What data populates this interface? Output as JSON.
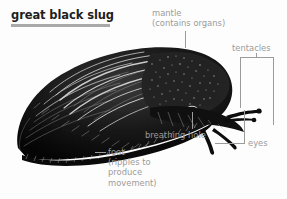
{
  "figure": {
    "title": "great black slug",
    "subject": "great black slug",
    "accent_rule_color": "#a9a9a9",
    "title_color": "#1f1f1f",
    "label_color": "#9b9b9b",
    "background_color": "#fdfdfd",
    "illustration_color": "#111111"
  },
  "labels": {
    "mantle": "mantle\n(contains organs)",
    "tentacles": "tentacles",
    "breathing_hole": "breathing hole",
    "eyes": "eyes",
    "foot": "foot\n(ripples to\nproduce\nmovement)"
  },
  "icons": {
    "slug": "slug-illustration"
  }
}
